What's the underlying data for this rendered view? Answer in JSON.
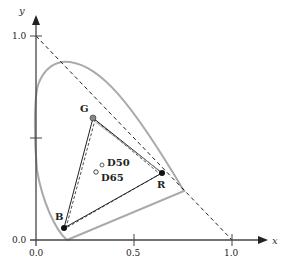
{
  "diagram": {
    "type": "CIE 1931 xy chromaticity diagram",
    "axes": {
      "x_label": "x",
      "y_label": "y",
      "x_ticks": [
        "0.0",
        "0.5",
        "1.0"
      ],
      "y_ticks": [
        "0.0",
        "1.0"
      ]
    },
    "primaries": [
      {
        "label": "R",
        "x": 0.64,
        "y": 0.33
      },
      {
        "label": "G",
        "x": 0.3,
        "y": 0.6
      },
      {
        "label": "B",
        "x": 0.15,
        "y": 0.06
      }
    ],
    "white_points": [
      {
        "label": "D50",
        "x": 0.3457,
        "y": 0.3585
      },
      {
        "label": "D65",
        "x": 0.3127,
        "y": 0.329
      }
    ],
    "elements": {
      "spectral_locus": "gray curve",
      "gamut_triangle_solid": "RGB gamut (solid)",
      "gamut_triangle_dashed": "RGB gamut (dashed, offset)",
      "boundary_line": "x + y = 1 (dashed)"
    },
    "colors": {
      "locus": "#aaaaaa",
      "lines": "#222222",
      "axes": "#444444"
    }
  }
}
